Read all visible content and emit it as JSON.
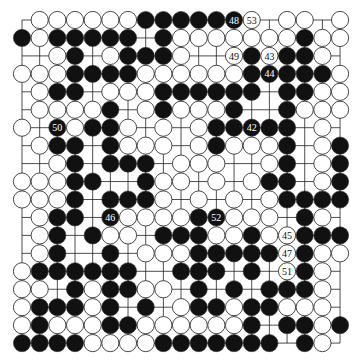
{
  "diagram": {
    "type": "go-board",
    "size": 19,
    "colors": {
      "background": "#ffffff",
      "line": "#222222",
      "black": "#111111",
      "white": "#ffffff",
      "stone_outline": "#333333"
    },
    "legend": {
      "B": "black stone",
      "W": "white stone",
      ".": "empty intersection"
    },
    "rows": [
      ".WWWWWWBBBBBBW.WW.W",
      "BWBBBBB.BWWWWWWWBWW",
      "..WB.WBBBW..WBWBBW.",
      "WWWBBBBWWWWWWBBBBBW",
      ".WBB.WWWBBBBBB.BBWW",
      ".WWWWB.WBWWWB..BWWW",
      "W.BWBBW.W.WBBBBB.W.",
      ".WBB.BWWW.WBWWWB.WB",
      "..WB.BBB.WWW..WB.WB",
      "WWWBB..BWW.W.WBB.WB",
      "WWWB.BBBW.W.W.WBBBB",
      ".WBB.BWWWWBBWWW.BW.",
      ".WB.BWW.BBBWWBWWBBB",
      ".WB..B.WWWBBBBBWBWW",
      "WBBBBBB..BBB.B.WBW.",
      "WW.BWBBWW.B.B.BBBW.",
      "WBBBWB.B.WBBWBBWWW.",
      "WBWWWBBWWWWWWB.BBWB",
      "BBBBWWWWBBBBBBB.BW."
    ],
    "numbered_moves": [
      {
        "label": "42",
        "color": "B",
        "row": 7,
        "col": 14
      },
      {
        "label": "43",
        "color": "W",
        "row": 3,
        "col": 15
      },
      {
        "label": "44",
        "color": "B",
        "row": 4,
        "col": 15
      },
      {
        "label": "45",
        "color": "W",
        "row": 13,
        "col": 16
      },
      {
        "label": "46",
        "color": "B",
        "row": 12,
        "col": 6
      },
      {
        "label": "47",
        "color": "W",
        "row": 14,
        "col": 16
      },
      {
        "label": "48",
        "color": "B",
        "row": 1,
        "col": 13
      },
      {
        "label": "49",
        "color": "W",
        "row": 3,
        "col": 13
      },
      {
        "label": "50",
        "color": "B",
        "row": 7,
        "col": 3
      },
      {
        "label": "51",
        "color": "W",
        "row": 15,
        "col": 16
      },
      {
        "label": "52",
        "color": "B",
        "row": 12,
        "col": 12
      },
      {
        "label": "53",
        "color": "W",
        "row": 1,
        "col": 14
      }
    ]
  }
}
